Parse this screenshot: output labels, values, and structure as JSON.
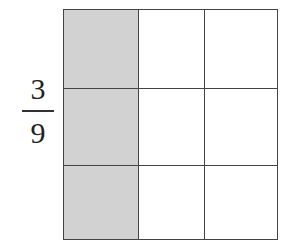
{
  "fraction": {
    "numerator": "3",
    "denominator": "9"
  },
  "grid": {
    "rows": 3,
    "columns": 3,
    "shaded_column": 0,
    "shaded_cells": 3,
    "total_cells": 9,
    "shade_color": "#d2d2d2",
    "line_color": "#444444"
  }
}
